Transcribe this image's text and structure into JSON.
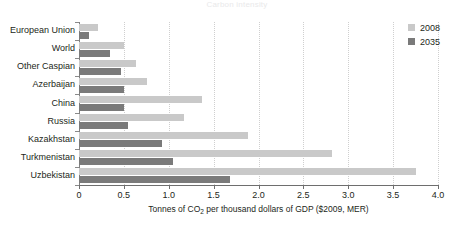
{
  "chart_data": {
    "type": "bar",
    "orientation": "horizontal",
    "title": "Carbon intensity",
    "xlabel": "Tonnes of CO2 per thousand dollars of GDP ($2009, MER)",
    "xlabel_parts": {
      "before": "Tonnes of CO",
      "sub": "2",
      "after": " per thousand dollars of GDP ($2009, MER)"
    },
    "ylabel": "",
    "categories": [
      "European Union",
      "World",
      "Other Caspian",
      "Azerbaijan",
      "China",
      "Russia",
      "Kazakhstan",
      "Turkmenistan",
      "Uzbekistan"
    ],
    "series": [
      {
        "name": "2008",
        "color": "#c9c9c9",
        "values": [
          0.21,
          0.5,
          0.63,
          0.76,
          1.37,
          1.17,
          1.88,
          2.82,
          3.75
        ]
      },
      {
        "name": "2035",
        "color": "#7a7a7a",
        "values": [
          0.11,
          0.35,
          0.47,
          0.5,
          0.5,
          0.55,
          0.93,
          1.05,
          1.68
        ]
      }
    ],
    "xlim": [
      0,
      4.0
    ],
    "xticks": [
      0,
      0.5,
      1.0,
      1.5,
      2.0,
      2.5,
      3.0,
      3.5,
      4.0
    ],
    "xtick_labels": [
      "0",
      "0.5",
      "1.0",
      "1.5",
      "2.0",
      "2.5",
      "3.0",
      "3.5",
      "4.0"
    ],
    "grid": true,
    "grid_style": "dotted-vertical",
    "legend_position": "top-right",
    "legend": [
      {
        "label": "2008",
        "color": "#c9c9c9"
      },
      {
        "label": "2035",
        "color": "#7a7a7a"
      }
    ]
  }
}
